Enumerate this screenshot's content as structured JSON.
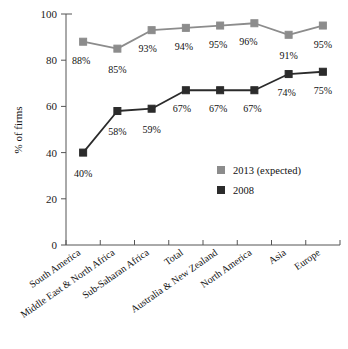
{
  "chart_data": {
    "type": "line",
    "title": "",
    "xlabel": "",
    "ylabel": "% of firms",
    "ylim": [
      0,
      100
    ],
    "yticks": [
      0,
      20,
      40,
      60,
      80,
      100
    ],
    "grid": false,
    "legend_position": "bottom-right",
    "categories": [
      "South America",
      "Middle East & North Africa",
      "Sub-Saharan Africa",
      "Total",
      "Australia & New Zealand",
      "North America",
      "Asia",
      "Europe"
    ],
    "series": [
      {
        "name": "2013 (expected)",
        "color": "#8c8c8c",
        "values": [
          88,
          85,
          93,
          94,
          95,
          96,
          91,
          95
        ],
        "labels": [
          "88%",
          "85%",
          "93%",
          "94%",
          "95%",
          "96%",
          "91%",
          "95%"
        ]
      },
      {
        "name": "2008",
        "color": "#2b2b2b",
        "values": [
          40,
          58,
          59,
          67,
          67,
          67,
          74,
          75
        ],
        "labels": [
          "40%",
          "58%",
          "59%",
          "67%",
          "67%",
          "67%",
          "74%",
          "75%"
        ]
      }
    ]
  },
  "axis": {
    "ylabel": "% of firms",
    "ytick_labels": [
      "0",
      "20",
      "40",
      "60",
      "80",
      "100"
    ]
  },
  "legend": {
    "items": [
      {
        "label": "2013 (expected)",
        "color": "#8c8c8c"
      },
      {
        "label": "2008",
        "color": "#2b2b2b"
      }
    ]
  }
}
